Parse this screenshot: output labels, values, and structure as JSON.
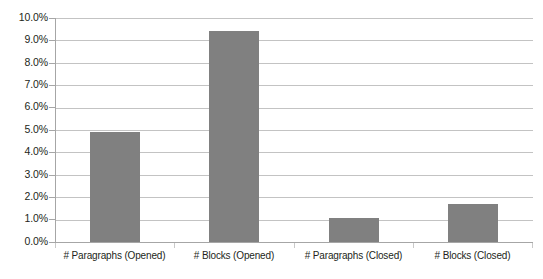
{
  "chart_data": {
    "type": "bar",
    "title": "",
    "subtitle": "",
    "xlabel": "",
    "ylabel": "",
    "categories": [
      "# Paragraphs (Opened)",
      "# Blocks (Opened)",
      "# Paragraphs (Closed)",
      "# Blocks (Closed)"
    ],
    "values": [
      4.9,
      9.4,
      1.05,
      1.7
    ],
    "value_labels": [
      "4.9%",
      "9.4%",
      "1.1%",
      "1.7%"
    ],
    "ylim": [
      0.0,
      10.0
    ],
    "ytick_values": [
      0.0,
      1.0,
      2.0,
      3.0,
      4.0,
      5.0,
      6.0,
      7.0,
      8.0,
      9.0,
      10.0
    ],
    "ytick_labels": [
      "0.0%",
      "1.0%",
      "2.0%",
      "3.0%",
      "4.0%",
      "5.0%",
      "6.0%",
      "7.0%",
      "8.0%",
      "9.0%",
      "10.0%"
    ],
    "grid": true,
    "grid_axis": "y",
    "legend": false,
    "legend_position": "none",
    "annotations": [],
    "colors": {
      "bar_fill": "#808080",
      "gridline": "#c3c3c3",
      "axis_line": "#a6a6a6",
      "text": "#231f20",
      "background": "#ffffff"
    }
  }
}
